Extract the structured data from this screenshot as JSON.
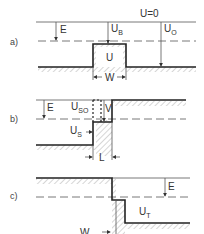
{
  "figure": {
    "panels": [
      {
        "id": "a",
        "label": "a)",
        "top_level_label": "U=0",
        "labels": {
          "E": "E",
          "UB_main": "U",
          "UB_sub": "B",
          "UO_main": "U",
          "UO_sub": "O",
          "U": "U",
          "W": "W"
        }
      },
      {
        "id": "b",
        "label": "b)",
        "labels": {
          "E": "E",
          "USO_main": "U",
          "USO_sub": "SO",
          "V": "V",
          "US_main": "U",
          "US_sub": "S",
          "L": "L"
        }
      },
      {
        "id": "c",
        "label": "c)",
        "labels": {
          "E": "E",
          "UT_main": "U",
          "UT_sub": "T",
          "W": "W"
        }
      }
    ],
    "colors": {
      "line": "#555555",
      "thick_line": "#222222",
      "background": "#ffffff"
    }
  }
}
